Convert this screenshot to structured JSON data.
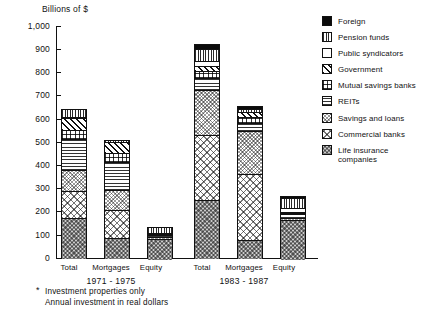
{
  "chart_data": {
    "type": "bar",
    "subtype": "stacked",
    "title": "Billions of $",
    "xlabel": "",
    "ylabel": "Billions of $",
    "ylim": [
      0,
      1000
    ],
    "ytick_labels": [
      "1,000",
      "900",
      "800",
      "700",
      "600",
      "500",
      "400",
      "300",
      "200",
      "100",
      "0"
    ],
    "ytick_values": [
      1000,
      900,
      800,
      700,
      600,
      500,
      400,
      300,
      200,
      100,
      0
    ],
    "grid": false,
    "legend_position": "right",
    "categories": [
      "Total",
      "Mortgages",
      "Equity",
      "Total",
      "Mortgages",
      "Equity"
    ],
    "groups": [
      {
        "label": "1971 - 1975",
        "categories": [
          "Total",
          "Mortgages",
          "Equity"
        ]
      },
      {
        "label": "1983 - 1987",
        "categories": [
          "Total",
          "Mortgages",
          "Equity"
        ]
      }
    ],
    "series": [
      {
        "name": "Life insurance companies",
        "pattern": "p-life",
        "values": [
          172,
          88,
          84,
          250,
          78,
          172
        ]
      },
      {
        "name": "Commercial banks",
        "pattern": "p-commercial",
        "values": [
          117,
          118,
          0,
          282,
          282,
          0
        ]
      },
      {
        "name": "Savings and loans",
        "pattern": "p-savings",
        "values": [
          92,
          85,
          7,
          192,
          186,
          6
        ]
      },
      {
        "name": "REITs",
        "pattern": "p-reits",
        "values": [
          131,
          121,
          10,
          52,
          35,
          17
        ]
      },
      {
        "name": "Mutual savings banks",
        "pattern": "p-mutual",
        "values": [
          42,
          42,
          0,
          29,
          28,
          1
        ]
      },
      {
        "name": "Government",
        "pattern": "p-government",
        "values": [
          50,
          48,
          2,
          23,
          22,
          1
        ]
      },
      {
        "name": "Public syndicators",
        "pattern": "p-public",
        "values": [
          4,
          0,
          4,
          20,
          0,
          20
        ]
      },
      {
        "name": "Pension funds",
        "pattern": "p-pension",
        "values": [
          35,
          8,
          27,
          52,
          10,
          42
        ]
      },
      {
        "name": "Foreign",
        "pattern": "p-foreign",
        "values": [
          0,
          0,
          0,
          24,
          14,
          10
        ]
      }
    ],
    "bar_totals": [
      643,
      510,
      134,
      924,
      655,
      269
    ],
    "legend_entries": [
      "Foreign",
      "Pension funds",
      "Public syndicators",
      "Government",
      "Mutual savings banks",
      "REITs",
      "Savings and loans",
      "Commercial banks",
      "Life insurance\ncompanies"
    ],
    "footnote": {
      "marker": "*",
      "line1": "Investment properties only",
      "line2": "Annual investment in real dollars"
    },
    "colors": {
      "foreground": "#111111",
      "background": "#ffffff",
      "foreign": "#0b0b0b"
    }
  }
}
